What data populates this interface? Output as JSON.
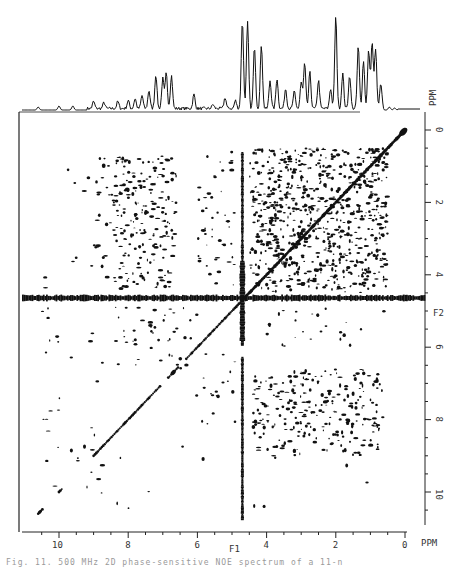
{
  "figure": {
    "caption": "Fig. 11. 500 MHz 2D phase-sensitive NOE spectrum of a 11-n",
    "background": "#ffffff",
    "ink": "#111111"
  },
  "chart_data": {
    "type": "heatmap",
    "subtype": "2D NMR contour plot with 1D projection",
    "title": "",
    "x_axis": {
      "name": "F1",
      "unit_label": "PPM",
      "range": [
        11,
        0
      ],
      "ticks": [
        10,
        8,
        6,
        4,
        2,
        0
      ],
      "minor_tick_step": 0.5
    },
    "y_axis": {
      "name": "F2",
      "unit_label": "PPM",
      "position": "right",
      "range": [
        0,
        10.5
      ],
      "ticks": [
        0,
        2,
        4,
        6,
        8,
        10
      ],
      "minor_tick_step": 0.5
    },
    "top_projection_label": "PPM",
    "solvent_ridge_ppm": 4.7,
    "diagonal": {
      "from_ppm": 0.0,
      "to_ppm": 10.6
    },
    "projection_peaks": [
      {
        "ppm": 10.6,
        "h": 3
      },
      {
        "ppm": 10.0,
        "h": 4
      },
      {
        "ppm": 9.6,
        "h": 4
      },
      {
        "ppm": 9.0,
        "h": 7
      },
      {
        "ppm": 8.7,
        "h": 6
      },
      {
        "ppm": 8.3,
        "h": 7
      },
      {
        "ppm": 8.0,
        "h": 8
      },
      {
        "ppm": 7.8,
        "h": 10
      },
      {
        "ppm": 7.6,
        "h": 13
      },
      {
        "ppm": 7.4,
        "h": 18
      },
      {
        "ppm": 7.2,
        "h": 34
      },
      {
        "ppm": 7.0,
        "h": 30
      },
      {
        "ppm": 6.9,
        "h": 35
      },
      {
        "ppm": 6.75,
        "h": 33
      },
      {
        "ppm": 6.1,
        "h": 14
      },
      {
        "ppm": 5.55,
        "h": 4
      },
      {
        "ppm": 5.2,
        "h": 11
      },
      {
        "ppm": 4.9,
        "h": 8
      },
      {
        "ppm": 4.7,
        "h": 88
      },
      {
        "ppm": 4.55,
        "h": 86
      },
      {
        "ppm": 4.35,
        "h": 62
      },
      {
        "ppm": 4.15,
        "h": 64
      },
      {
        "ppm": 3.9,
        "h": 28
      },
      {
        "ppm": 3.7,
        "h": 30
      },
      {
        "ppm": 3.45,
        "h": 20
      },
      {
        "ppm": 3.2,
        "h": 17
      },
      {
        "ppm": 3.0,
        "h": 26
      },
      {
        "ppm": 2.9,
        "h": 45
      },
      {
        "ppm": 2.75,
        "h": 36
      },
      {
        "ppm": 2.5,
        "h": 28
      },
      {
        "ppm": 2.15,
        "h": 20
      },
      {
        "ppm": 2.0,
        "h": 92
      },
      {
        "ppm": 1.8,
        "h": 35
      },
      {
        "ppm": 1.6,
        "h": 33
      },
      {
        "ppm": 1.35,
        "h": 62
      },
      {
        "ppm": 1.2,
        "h": 48
      },
      {
        "ppm": 1.05,
        "h": 58
      },
      {
        "ppm": 0.95,
        "h": 66
      },
      {
        "ppm": 0.85,
        "h": 60
      },
      {
        "ppm": 0.7,
        "h": 24
      },
      {
        "ppm": 0.45,
        "h": 3
      },
      {
        "ppm": 0.3,
        "h": 2
      }
    ],
    "cross_peaks_note": "Dense NOE cross-peaks concentrated in the aliphatic region (F1 0-4.5, F2 0-6) and amide/aromatic region (F1 6.5-8.5 vs F2 0-5), plus water t1-noise ridges at 4.7 ppm",
    "cross_peak_regions": [
      {
        "f1": [
          0.5,
          4.5
        ],
        "f2": [
          0.5,
          4.4
        ],
        "density": 0.55
      },
      {
        "f1": [
          6.6,
          8.4
        ],
        "f2": [
          0.8,
          4.4
        ],
        "density": 0.35
      },
      {
        "f1": [
          0.6,
          4.4
        ],
        "f2": [
          6.7,
          9.0
        ],
        "density": 0.35
      },
      {
        "f1": [
          4.9,
          6.0
        ],
        "f2": [
          0.6,
          4.4
        ],
        "density": 0.2
      },
      {
        "f1": [
          6.0,
          8.5
        ],
        "f2": [
          4.9,
          6.5
        ],
        "density": 0.18
      },
      {
        "f1": [
          8.5,
          10.5
        ],
        "f2": [
          0.5,
          10.3
        ],
        "density": 0.04
      }
    ]
  }
}
